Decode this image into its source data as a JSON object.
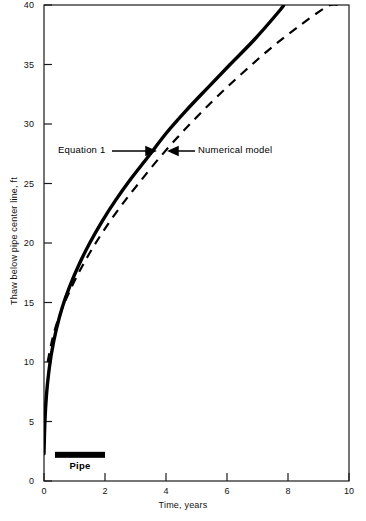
{
  "chart_data": {
    "type": "line",
    "title": "",
    "xlabel": "Time, years",
    "ylabel": "Thaw below pipe center line, ft",
    "xlim": [
      0,
      10
    ],
    "ylim": [
      0,
      40
    ],
    "xticks": [
      0,
      2,
      4,
      6,
      8,
      10
    ],
    "yticks": [
      0,
      5,
      10,
      15,
      20,
      25,
      30,
      35,
      40
    ],
    "xtick_labels": [
      "0",
      "2",
      "4",
      "6",
      "8",
      "10"
    ],
    "ytick_labels": [
      "0",
      "5",
      "10",
      "15",
      "20",
      "25",
      "30",
      "35",
      "40"
    ],
    "grid": false,
    "legend": "none",
    "series": [
      {
        "name": "Equation 1",
        "style": "solid",
        "color": "#000000",
        "linewidth": 3.4,
        "x": [
          0.0,
          0.03,
          0.08,
          0.15,
          0.25,
          0.4,
          0.6,
          0.85,
          1.15,
          1.5,
          1.9,
          2.35,
          2.85,
          3.4,
          4.0,
          4.65,
          5.35,
          6.1,
          6.9,
          7.75,
          7.85
        ],
        "y": [
          2.3,
          5.0,
          7.2,
          9.0,
          10.8,
          12.7,
          14.6,
          16.4,
          18.2,
          20.0,
          21.8,
          23.6,
          25.4,
          27.2,
          29.2,
          31.1,
          33.0,
          35.0,
          37.1,
          39.6,
          40.0
        ]
      },
      {
        "name": "Numerical model",
        "style": "dashed",
        "color": "#000000",
        "linewidth": 2.2,
        "dash": "9,7",
        "x": [
          0.12,
          0.3,
          0.55,
          0.85,
          1.2,
          1.6,
          2.05,
          2.55,
          3.1,
          3.7,
          4.35,
          5.05,
          5.8,
          6.6,
          7.45,
          8.35,
          9.3,
          9.65
        ],
        "y": [
          10.0,
          12.2,
          14.2,
          16.0,
          17.8,
          19.6,
          21.4,
          23.2,
          25.0,
          26.9,
          28.8,
          30.7,
          32.6,
          34.5,
          36.4,
          38.2,
          39.9,
          40.0
        ]
      }
    ],
    "annotations": [
      {
        "name": "equation-1",
        "text": "Equation 1",
        "arrow": "right",
        "arrow_glyph": "⟶",
        "x_data": 1.1,
        "y_data": 27.8
      },
      {
        "name": "numerical-model",
        "text": "Numerical model",
        "arrow": "left",
        "arrow_glyph": "⟵",
        "x_data": 4.5,
        "y_data": 27.8
      }
    ],
    "markers": [
      {
        "name": "pipe",
        "label": "Pipe",
        "type": "bar",
        "x_start": 0.36,
        "x_end": 2.0,
        "y": 2.2,
        "color": "#000000"
      }
    ]
  }
}
